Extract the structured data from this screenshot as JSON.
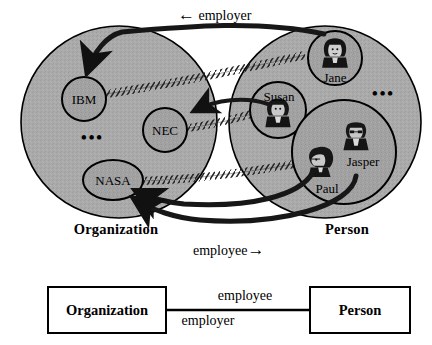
{
  "diagram": {
    "title_visible": false,
    "colors": {
      "set_fill": "#a9a9a9",
      "node_fill": "#a0a0a0",
      "outline": "#000000",
      "background": "#ffffff",
      "hatch": "#2b2b2b",
      "box_fill": "#ffffff"
    },
    "sets": [
      {
        "id": "organization",
        "label": "Organization",
        "side": "left"
      },
      {
        "id": "person",
        "label": "Person",
        "side": "right"
      }
    ],
    "organization_members": [
      {
        "id": "ibm",
        "label": "IBM",
        "shape": "circle"
      },
      {
        "id": "nec",
        "label": "NEC",
        "shape": "circle"
      },
      {
        "id": "nasa",
        "label": "NASA",
        "shape": "ellipse"
      }
    ],
    "person_members": [
      {
        "id": "jane",
        "label": "Jane",
        "shape": "circle",
        "icon": "face-woman-icon"
      },
      {
        "id": "susan",
        "label": "Susan",
        "shape": "circle",
        "icon": "face-woman-icon"
      },
      {
        "id": "paul",
        "label": "Paul",
        "shape": "circle",
        "icon": "face-person-icon"
      },
      {
        "id": "jasper",
        "label": "Jasper",
        "shape": "circle",
        "icon": "face-man-icon"
      }
    ],
    "ellipsis": [
      {
        "id": "org-ellipsis",
        "label": "•••"
      },
      {
        "id": "person-ellipsis",
        "label": "•••"
      }
    ],
    "relation_labels": {
      "employer_top": "employer",
      "employer_arrow": "←",
      "employee_bottom": "employee",
      "employee_arrow": "→"
    },
    "links": [
      {
        "from": "ibm",
        "to": "jane",
        "style": "hatched"
      },
      {
        "from": "nec",
        "to": "susan",
        "style": "hatched"
      },
      {
        "from": "nasa",
        "to": "paul",
        "style": "hatched"
      }
    ],
    "arrows": [
      {
        "from": "jane",
        "to": "ibm",
        "relation": "employer"
      },
      {
        "from": "susan",
        "to": "nec",
        "relation": "employer"
      },
      {
        "from": "paul",
        "to": "nasa",
        "relation": "employee"
      },
      {
        "from": "jasper",
        "to": "nasa",
        "relation": "employee"
      }
    ]
  },
  "schema": {
    "left_box": "Organization",
    "right_box": "Person",
    "edge_label_above": "employee",
    "edge_label_below": "employer"
  }
}
